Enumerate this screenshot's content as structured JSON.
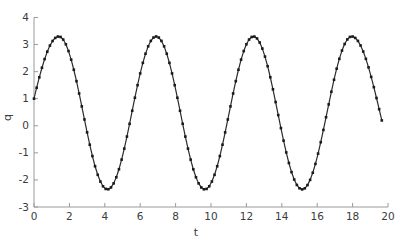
{
  "chart_data": {
    "type": "line",
    "title": "",
    "xlabel": "t",
    "ylabel": "q",
    "xlim": [
      0,
      20
    ],
    "ylim": [
      -3,
      4
    ],
    "xticks": [
      0,
      2,
      4,
      6,
      8,
      10,
      12,
      14,
      16,
      18,
      20
    ],
    "yticks": [
      -3,
      -2,
      -1,
      0,
      1,
      2,
      3,
      4
    ],
    "grid": false,
    "legend": "none",
    "series_name": "q(t)",
    "line_color": "#2b2b2b",
    "marker": "point",
    "marker_color": "#1a1a1a",
    "axis_color": "#9a9a9a",
    "tick_label_color": "#3c3c3c",
    "background_color": "#ffffff",
    "start_point": {
      "t": 0,
      "q": 1.0
    },
    "end_point": {
      "t": 19.65,
      "q": 0.1
    },
    "peaks": {
      "t": [
        1.4,
        6.9,
        12.4,
        17.95
      ],
      "q": 3.3
    },
    "troughs": {
      "t": [
        4.15,
        9.65,
        15.15
      ],
      "q": -2.35
    },
    "sample_t_start": 0,
    "sample_t_end": 19.65,
    "sample_step": 0.15,
    "waveform_segments": [
      {
        "t0": -1.78,
        "q0": -2.35,
        "t1": 1.4,
        "q1": 3.3
      },
      {
        "t0": 1.4,
        "q0": 3.3,
        "t1": 4.15,
        "q1": -2.35
      },
      {
        "t0": 4.15,
        "q0": -2.35,
        "t1": 6.9,
        "q1": 3.3
      },
      {
        "t0": 6.9,
        "q0": 3.3,
        "t1": 9.65,
        "q1": -2.35
      },
      {
        "t0": 9.65,
        "q0": -2.35,
        "t1": 12.4,
        "q1": 3.3
      },
      {
        "t0": 12.4,
        "q0": 3.3,
        "t1": 15.15,
        "q1": -2.35
      },
      {
        "t0": 15.15,
        "q0": -2.35,
        "t1": 17.95,
        "q1": 3.3
      },
      {
        "t0": 17.95,
        "q0": 3.3,
        "t1": 21.15,
        "q1": -2.35
      }
    ]
  }
}
